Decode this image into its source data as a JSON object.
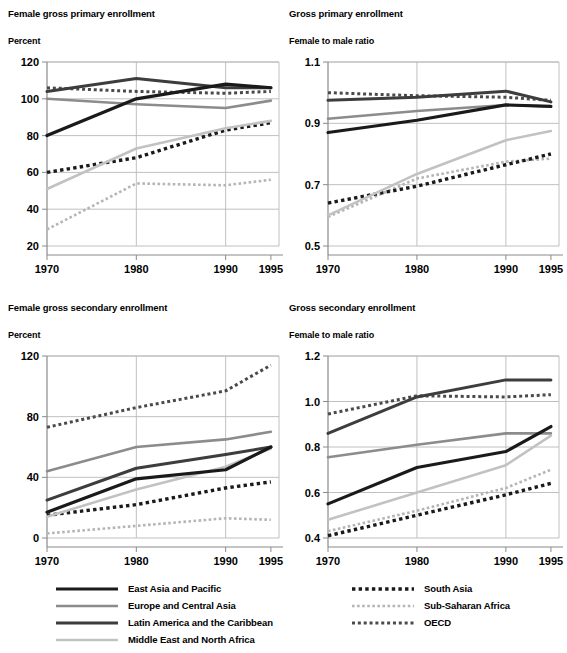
{
  "chart_data": [
    {
      "id": "female_gross_primary_enrollment",
      "type": "line",
      "title": "Female gross primary enrollment",
      "ylabel": "Percent",
      "xlabel": "",
      "x": [
        "1970",
        "1980",
        "1990",
        "1995"
      ],
      "ylim": [
        20,
        120
      ],
      "yticks": [
        20,
        40,
        60,
        80,
        100,
        120
      ],
      "grid": true,
      "legend": "bottom",
      "series": [
        {
          "name": "East Asia and Pacific",
          "values": [
            80,
            100,
            108,
            106
          ]
        },
        {
          "name": "Europe and Central Asia",
          "values": [
            100,
            97,
            95,
            99
          ]
        },
        {
          "name": "Latin America and the Caribbean",
          "values": [
            104,
            111,
            106,
            106
          ]
        },
        {
          "name": "Middle East and North Africa",
          "values": [
            51,
            73,
            84,
            88
          ]
        },
        {
          "name": "South Asia",
          "values": [
            60,
            68,
            83,
            87
          ]
        },
        {
          "name": "Sub-Saharan Africa",
          "values": [
            29,
            54,
            53,
            56
          ]
        },
        {
          "name": "OECD",
          "values": [
            106,
            104,
            103,
            104
          ]
        }
      ]
    },
    {
      "id": "gross_primary_enrollment_ratio",
      "type": "line",
      "title": "Gross primary enrollment",
      "ylabel": "Female to male ratio",
      "xlabel": "",
      "x": [
        "1970",
        "1980",
        "1990",
        "1995"
      ],
      "ylim": [
        0.5,
        1.1
      ],
      "yticks": [
        0.5,
        0.7,
        0.9,
        1.1
      ],
      "grid": true,
      "legend": "bottom",
      "series": [
        {
          "name": "East Asia and Pacific",
          "values": [
            0.87,
            0.91,
            0.96,
            0.955
          ]
        },
        {
          "name": "Europe and Central Asia",
          "values": [
            0.915,
            0.94,
            0.96,
            0.955
          ]
        },
        {
          "name": "Latin America and the Caribbean",
          "values": [
            0.975,
            0.985,
            1.005,
            0.97
          ]
        },
        {
          "name": "Middle East and North Africa",
          "values": [
            0.6,
            0.735,
            0.845,
            0.875
          ]
        },
        {
          "name": "South Asia",
          "values": [
            0.64,
            0.695,
            0.765,
            0.8
          ]
        },
        {
          "name": "Sub-Saharan Africa",
          "values": [
            0.595,
            0.72,
            0.775,
            0.785
          ]
        },
        {
          "name": "OECD",
          "values": [
            1.0,
            0.99,
            0.985,
            0.975
          ]
        }
      ]
    },
    {
      "id": "female_gross_secondary_enrollment",
      "type": "line",
      "title": "Female gross secondary enrollment",
      "ylabel": "Percent",
      "xlabel": "",
      "x": [
        "1970",
        "1980",
        "1990",
        "1995"
      ],
      "ylim": [
        0,
        120
      ],
      "yticks": [
        0,
        40,
        80,
        120
      ],
      "grid": true,
      "legend": "bottom",
      "series": [
        {
          "name": "East Asia and Pacific",
          "values": [
            17,
            39,
            45,
            60
          ]
        },
        {
          "name": "Europe and Central Asia",
          "values": [
            44,
            60,
            65,
            70
          ]
        },
        {
          "name": "Latin America and the Caribbean",
          "values": [
            25,
            46,
            55,
            60
          ]
        },
        {
          "name": "Middle East and North Africa",
          "values": [
            14,
            32,
            47,
            59
          ]
        },
        {
          "name": "South Asia",
          "values": [
            15,
            22,
            33,
            37
          ]
        },
        {
          "name": "Sub-Saharan Africa",
          "values": [
            3,
            8,
            13,
            12
          ]
        },
        {
          "name": "OECD",
          "values": [
            73,
            86,
            97,
            114
          ]
        }
      ]
    },
    {
      "id": "gross_secondary_enrollment_ratio",
      "type": "line",
      "title": "Gross secondary enrollment",
      "ylabel": "Female to male ratio",
      "xlabel": "",
      "x": [
        "1970",
        "1980",
        "1990",
        "1995"
      ],
      "ylim": [
        0.4,
        1.2
      ],
      "yticks": [
        0.4,
        0.6,
        0.8,
        1.0,
        1.2
      ],
      "grid": true,
      "legend": "bottom",
      "series": [
        {
          "name": "East Asia and Pacific",
          "values": [
            0.55,
            0.71,
            0.78,
            0.89
          ]
        },
        {
          "name": "Europe and Central Asia",
          "values": [
            0.755,
            0.81,
            0.86,
            0.86
          ]
        },
        {
          "name": "Latin America and the Caribbean",
          "values": [
            0.86,
            1.02,
            1.095,
            1.095
          ]
        },
        {
          "name": "Middle East and North Africa",
          "values": [
            0.48,
            0.6,
            0.72,
            0.85
          ]
        },
        {
          "name": "South Asia",
          "values": [
            0.41,
            0.5,
            0.59,
            0.64
          ]
        },
        {
          "name": "Sub-Saharan Africa",
          "values": [
            0.43,
            0.52,
            0.62,
            0.7
          ]
        },
        {
          "name": "OECD",
          "values": [
            0.945,
            1.025,
            1.02,
            1.03
          ]
        }
      ]
    }
  ],
  "legend": {
    "left_column": [
      {
        "label": "East Asia and Pacific",
        "style": "solid",
        "color": "#1a1a1a",
        "width": 3.2
      },
      {
        "label": "Europe and Central Asia",
        "style": "solid",
        "color": "#8c8c8c",
        "width": 2.6
      },
      {
        "label": "Latin America and the Caribbean",
        "style": "solid",
        "color": "#3d3d3d",
        "width": 3.0
      },
      {
        "label": "Middle East and North Africa",
        "style": "solid",
        "color": "#c2c2c2",
        "width": 2.6
      }
    ],
    "right_column": [
      {
        "label": "South Asia",
        "style": "dotted",
        "color": "#1a1a1a",
        "width": 3.4
      },
      {
        "label": "Sub-Saharan Africa",
        "style": "dotted",
        "color": "#b5b5b5",
        "width": 2.6
      },
      {
        "label": "OECD",
        "style": "dotted",
        "color": "#4a4a4a",
        "width": 3.0
      }
    ]
  },
  "style": {
    "axis_color": "#8a8a8a",
    "grid_color": "#b9b9b9",
    "background": "#ffffff"
  }
}
